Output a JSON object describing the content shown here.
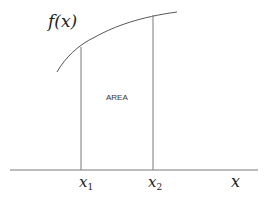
{
  "diagram": {
    "function_label": "f(x)",
    "area_label": "AREA",
    "x1_label": "x",
    "x1_sub": "1",
    "x2_label": "x",
    "x2_sub": "2",
    "axis_label": "x",
    "colors": {
      "curve": "#555555",
      "lines": "#777777",
      "axis": "#777777",
      "text": "#222222"
    }
  }
}
